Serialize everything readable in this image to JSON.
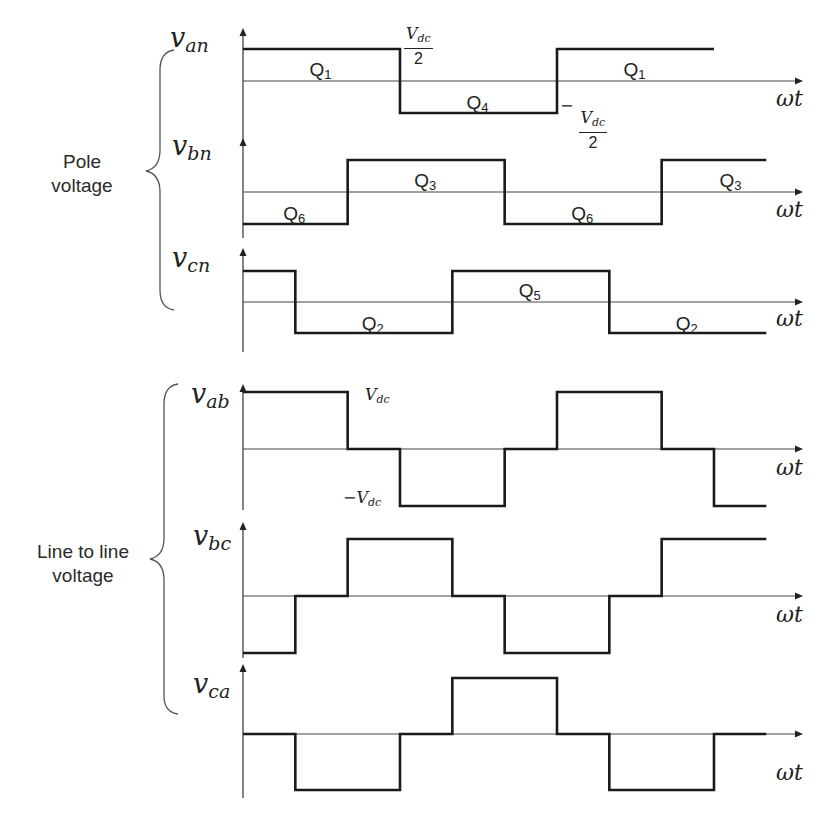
{
  "groups": [
    {
      "label_line1": "Pole",
      "label_line2": "voltage"
    },
    {
      "label_line1": "Line to line",
      "label_line2": "voltage"
    }
  ],
  "x_axis_label": "ωt",
  "annotations": {
    "vdc_half_pos_num": "V",
    "vdc_half_pos_sub": "dc",
    "vdc_half_den": "2",
    "vdc_half_neg_sign": "−",
    "vdc_pos": "V",
    "vdc_pos_sub": "dc",
    "vdc_neg": "−V",
    "vdc_neg_sub": "dc"
  },
  "chart_data": {
    "type": "line",
    "xlabel": "ωt",
    "x_unit": "degrees",
    "x_range": [
      0,
      420
    ],
    "grid": false,
    "series": [
      {
        "name": "v_an",
        "group": "Pole voltage",
        "label_base": "v",
        "label_sub": "an",
        "levels_unit": "Vdc/2",
        "steps": [
          [
            0,
            1
          ],
          [
            180,
            -1
          ],
          [
            360,
            1
          ],
          [
            540,
            -1
          ],
          [
            600,
            -1
          ]
        ],
        "switch_labels": [
          {
            "text": "Q",
            "sub": "1",
            "x": 90,
            "level": 1
          },
          {
            "text": "Q",
            "sub": "4",
            "x": 270,
            "level": -1
          },
          {
            "text": "Q",
            "sub": "1",
            "x": 450,
            "level": 1
          }
        ]
      },
      {
        "name": "v_bn",
        "group": "Pole voltage",
        "label_base": "v",
        "label_sub": "bn",
        "levels_unit": "Vdc/2",
        "steps": [
          [
            0,
            -1
          ],
          [
            120,
            1
          ],
          [
            300,
            -1
          ],
          [
            480,
            1
          ],
          [
            600,
            1
          ]
        ],
        "switch_labels": [
          {
            "text": "Q",
            "sub": "6",
            "x": 60,
            "level": -1
          },
          {
            "text": "Q",
            "sub": "3",
            "x": 210,
            "level": 1
          },
          {
            "text": "Q",
            "sub": "6",
            "x": 390,
            "level": -1
          },
          {
            "text": "Q",
            "sub": "3",
            "x": 560,
            "level": 1
          }
        ]
      },
      {
        "name": "v_cn",
        "group": "Pole voltage",
        "label_base": "v",
        "label_sub": "cn",
        "levels_unit": "Vdc/2",
        "steps": [
          [
            0,
            1
          ],
          [
            60,
            -1
          ],
          [
            240,
            1
          ],
          [
            420,
            -1
          ],
          [
            600,
            -1
          ]
        ],
        "switch_labels": [
          {
            "text": "Q",
            "sub": "2",
            "x": 150,
            "level": -1
          },
          {
            "text": "Q",
            "sub": "5",
            "x": 330,
            "level": 1
          },
          {
            "text": "Q",
            "sub": "2",
            "x": 510,
            "level": -1
          }
        ]
      },
      {
        "name": "v_ab",
        "group": "Line to line voltage",
        "label_base": "v",
        "label_sub": "ab",
        "levels_unit": "Vdc",
        "steps": [
          [
            0,
            1
          ],
          [
            120,
            0
          ],
          [
            180,
            -1
          ],
          [
            300,
            0
          ],
          [
            360,
            1
          ],
          [
            480,
            0
          ],
          [
            540,
            -1
          ],
          [
            600,
            -1
          ]
        ]
      },
      {
        "name": "v_bc",
        "group": "Line to line voltage",
        "label_base": "v",
        "label_sub": "bc",
        "levels_unit": "Vdc",
        "steps": [
          [
            0,
            -1
          ],
          [
            60,
            0
          ],
          [
            120,
            1
          ],
          [
            240,
            0
          ],
          [
            300,
            -1
          ],
          [
            420,
            0
          ],
          [
            480,
            1
          ],
          [
            600,
            1
          ]
        ]
      },
      {
        "name": "v_ca",
        "group": "Line to line voltage",
        "label_base": "v",
        "label_sub": "ca",
        "levels_unit": "Vdc",
        "steps": [
          [
            0,
            0
          ],
          [
            60,
            -1
          ],
          [
            180,
            0
          ],
          [
            240,
            1
          ],
          [
            360,
            0
          ],
          [
            420,
            -1
          ],
          [
            540,
            0
          ],
          [
            600,
            0
          ]
        ]
      }
    ],
    "level_annotations": [
      {
        "series": "v_an",
        "level": 1,
        "text": "Vdc/2"
      },
      {
        "series": "v_an",
        "level": -1,
        "text": "-Vdc/2"
      },
      {
        "series": "v_ab",
        "level": 1,
        "text": "Vdc"
      },
      {
        "series": "v_ab",
        "level": -1,
        "text": "-Vdc"
      }
    ]
  },
  "layout": {
    "axis_x": 243,
    "px_per_deg": 0.8722,
    "arrow_end_x": 803,
    "panels": [
      {
        "zero_y": 81,
        "amp": 32,
        "top_y": 28,
        "bottom_y": 140,
        "end_deg": 540,
        "label_x": 170,
        "label_y": 22,
        "wt_y": 86
      },
      {
        "zero_y": 192,
        "amp": 32,
        "top_y": 138,
        "bottom_y": 238,
        "end_deg": 600,
        "label_x": 172,
        "label_y": 130,
        "wt_y": 197
      },
      {
        "zero_y": 302,
        "amp": 31,
        "top_y": 248,
        "bottom_y": 352,
        "end_deg": 600,
        "label_x": 172,
        "label_y": 242,
        "wt_y": 306
      },
      {
        "zero_y": 449,
        "amp": 57,
        "top_y": 384,
        "bottom_y": 510,
        "end_deg": 600,
        "label_x": 191,
        "label_y": 378,
        "wt_y": 455
      },
      {
        "zero_y": 596,
        "amp": 57,
        "top_y": 522,
        "bottom_y": 658,
        "end_deg": 600,
        "label_x": 193,
        "label_y": 520,
        "wt_y": 602
      },
      {
        "zero_y": 734,
        "amp": 56,
        "top_y": 664,
        "bottom_y": 798,
        "end_deg": 600,
        "label_x": 193,
        "label_y": 668,
        "wt_y": 760
      }
    ]
  }
}
